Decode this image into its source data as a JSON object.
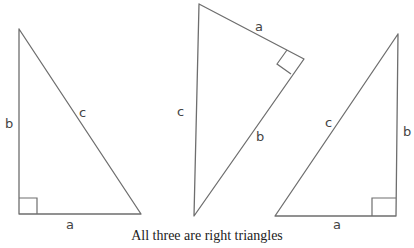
{
  "diagram": {
    "caption": "All three are right triangles",
    "line_color": "#6e6e6e",
    "triangles": [
      {
        "name": "left",
        "labels": {
          "a": "a",
          "b": "b",
          "c": "c"
        },
        "right_angle_at": "bottom-left"
      },
      {
        "name": "middle",
        "labels": {
          "a": "a",
          "b": "b",
          "c": "c"
        },
        "right_angle_at": "right"
      },
      {
        "name": "right",
        "labels": {
          "a": "a",
          "b": "b",
          "c": "c"
        },
        "right_angle_at": "bottom-right"
      }
    ]
  }
}
